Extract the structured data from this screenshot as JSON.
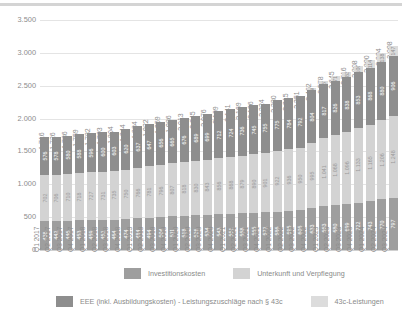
{
  "chart_data": {
    "type": "bar",
    "subtype": "stacked-vertical",
    "title": "",
    "xlabel": "",
    "ylabel": "",
    "ylim": [
      0,
      3500
    ],
    "yticks": [
      "0",
      "500",
      "1.000",
      "1.500",
      "2.000",
      "2.500",
      "3.000",
      "3.500"
    ],
    "ytick_values": [
      0,
      500,
      1000,
      1500,
      2000,
      2500,
      3000,
      3500
    ],
    "grid": true,
    "legend_position": "bottom",
    "categories": [
      "Q1 2017",
      "Q2 2017",
      "Q3 2017",
      "Q4 2017",
      "Q1 2018",
      "Q2 2018",
      "Q3 2018",
      "Q4 2018",
      "Q1 2019",
      "Q2 2019",
      "Q3 2019",
      "Q4 2019",
      "Q1 2020",
      "Q2 2020",
      "Q3 2020",
      "Q4 2020",
      "Q1 2021",
      "Q2 2021",
      "Q3 2021",
      "Q4 2021",
      "Q1 2022",
      "Q2 2022",
      "Q3 2022",
      "Q4 2022",
      "Q1 2023",
      "Q2 2023",
      "Q3 2023",
      "Q4 2023",
      "Q1 2024",
      "Q2 2024",
      "Q3 2024"
    ],
    "totals": [
      "1.716",
      "1.726",
      "1.736",
      "1.759",
      "1.782",
      "1.793",
      "1.804",
      "1.844",
      "1.884",
      "1.922",
      "1.959",
      "1.986",
      "2.013",
      "2.045",
      "2.076",
      "2.109",
      "2.141",
      "2.169",
      "2.196",
      "2.224",
      "2.280",
      "2.315",
      "2.351",
      "2.462",
      "2.578",
      "2.645",
      "2.716",
      "2.808",
      "2.890",
      "2.994",
      "3.098"
    ],
    "total_values": [
      1716,
      1726,
      1736,
      1759,
      1782,
      1793,
      1804,
      1844,
      1884,
      1922,
      1959,
      1986,
      2013,
      2045,
      2076,
      2109,
      2141,
      2169,
      2196,
      2224,
      2280,
      2315,
      2351,
      2462,
      2578,
      2645,
      2716,
      2808,
      2890,
      2994,
      3098
    ],
    "series": [
      {
        "name": "Investitionskosten",
        "color": "#9e9e9e",
        "values": [
          438,
          442,
          446,
          453,
          459,
          462,
          464,
          474,
          484,
          494,
          504,
          511,
          518,
          526,
          534,
          543,
          551,
          558,
          565,
          572,
          586,
          595,
          605,
          633,
          663,
          680,
          699,
          722,
          743,
          770,
          797
        ],
        "labels": [
          "438",
          "442",
          "446",
          "453",
          "459",
          "462",
          "464",
          "474",
          "484",
          "494",
          "504",
          "511",
          "518",
          "526",
          "534",
          "543",
          "551",
          "558",
          "565",
          "572",
          "586",
          "595",
          "605",
          "633",
          "663",
          "680",
          "699",
          "722",
          "743",
          "770",
          "797"
        ]
      },
      {
        "name": "Unterkunft und Verpflegung",
        "color": "#d3d3d3",
        "values": [
          702,
          706,
          710,
          718,
          727,
          731,
          735,
          750,
          766,
          781,
          796,
          807,
          818,
          830,
          843,
          856,
          868,
          879,
          890,
          901,
          922,
          936,
          950,
          995,
          1041,
          1068,
          1096,
          1133,
          1165,
          1206,
          1248
        ],
        "labels": [
          "702",
          "706",
          "710",
          "718",
          "727",
          "731",
          "735",
          "750",
          "766",
          "781",
          "796",
          "807",
          "818",
          "830",
          "843",
          "856",
          "868",
          "879",
          "890",
          "901",
          "922",
          "936",
          "950",
          "995",
          "1.041",
          "1.068",
          "1.096",
          "1.133",
          "1.165",
          "1.206",
          "1.248"
        ]
      },
      {
        "name": "EEE (inkl. Ausbildungskosten) - Leistungszuschläge nach § 43c",
        "color": "#8e8e8e",
        "values": [
          576,
          578,
          580,
          588,
          596,
          600,
          603,
          620,
          637,
          647,
          656,
          665,
          676,
          689,
          699,
          712,
          724,
          736,
          745,
          755,
          775,
          784,
          792,
          804,
          817,
          826,
          838,
          853,
          868,
          880,
          906
        ],
        "labels": [
          "576",
          "578",
          "580",
          "588",
          "596",
          "600",
          "603",
          "620",
          "637",
          "647",
          "656",
          "665",
          "676",
          "689",
          "699",
          "712",
          "724",
          "736",
          "745",
          "755",
          "775",
          "784",
          "792",
          "804",
          "817",
          "826",
          "838",
          "853",
          "868",
          "880",
          "906"
        ]
      },
      {
        "name": "43c-Leistungen",
        "color": "#dcdcdc",
        "values": [
          0,
          0,
          0,
          0,
          0,
          0,
          0,
          0,
          0,
          0,
          0,
          0,
          0,
          0,
          0,
          0,
          0,
          0,
          0,
          0,
          0,
          0,
          0,
          30,
          57,
          71,
          83,
          100,
          114,
          138,
          147
        ],
        "labels": [
          "",
          "",
          "",
          "",
          "",
          "",
          "",
          "",
          "",
          "",
          "",
          "",
          "",
          "",
          "",
          "",
          "",
          "",
          "",
          "",
          "",
          "",
          "",
          "30",
          "57",
          "71",
          "83",
          "100",
          "114",
          "138",
          "147"
        ]
      }
    ]
  },
  "legend": {
    "items": [
      {
        "label": "Investitionskosten",
        "color": "#9e9e9e",
        "swatch": "sw-inv"
      },
      {
        "label": "Unterkunft und Verpflegung",
        "color": "#d3d3d3",
        "swatch": "sw-unt"
      },
      {
        "label": "EEE (inkl. Ausbildungskosten) - Leistungszuschläge nach § 43c",
        "color": "#8e8e8e",
        "swatch": "sw-eee"
      },
      {
        "label": "43c-Leistungen",
        "color": "#dcdcdc",
        "swatch": "sw-43c"
      }
    ]
  }
}
